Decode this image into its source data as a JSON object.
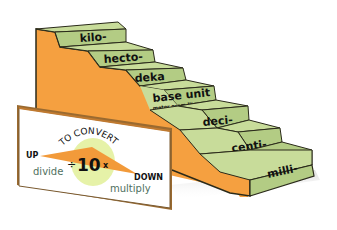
{
  "diagram": {
    "steps": [
      {
        "label": "kilo-"
      },
      {
        "label": "hecto-"
      },
      {
        "label": "deka"
      },
      {
        "label": "base unit",
        "sublabel": "meter  gram  liter"
      },
      {
        "label": "deci-"
      },
      {
        "label": "centi-"
      },
      {
        "label": "milli-"
      }
    ],
    "sign": {
      "heading": "TO CONVERT",
      "up": "UP",
      "down": "DOWN",
      "up_action": "divide",
      "down_action": "multiply",
      "divide_symbol": "÷",
      "factor": "10",
      "multiply_symbol": "x"
    },
    "colors": {
      "step_top": "#c8dc9a",
      "step_front": "#b3cc84",
      "stair_side": "#f5a040",
      "outline": "#2a2a1a",
      "sign_bg": "#ffffff",
      "sign_arrow": "#f29a3a",
      "sign_circle": "#e6f2a8",
      "action_text": "#4f7060"
    }
  }
}
